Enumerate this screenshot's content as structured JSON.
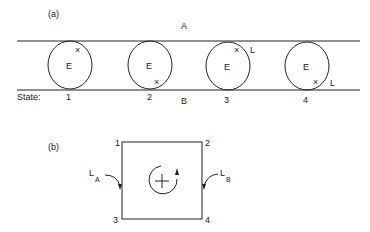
{
  "panel_a": {
    "label": "(a)",
    "region_top": "A",
    "region_bottom": "B",
    "state_label": "State:",
    "circle_label": "E",
    "states": [
      {
        "num": "1",
        "marker": "×",
        "marker_pos": "upper-right",
        "marker_label": ""
      },
      {
        "num": "2",
        "marker": "×",
        "marker_pos": "lower-right",
        "marker_label": ""
      },
      {
        "num": "3",
        "marker": "×",
        "marker_pos": "upper-right",
        "marker_label": "L"
      },
      {
        "num": "4",
        "marker": "×",
        "marker_pos": "lower-right",
        "marker_label": "L"
      }
    ]
  },
  "panel_b": {
    "label": "(b)",
    "corners": {
      "top_left": "1",
      "top_right": "2",
      "bottom_left": "3",
      "bottom_right": "4"
    },
    "left_arrow": {
      "main": "L",
      "sub": "A"
    },
    "right_arrow": {
      "main": "L",
      "sub": "B"
    },
    "center_symbol": "+"
  }
}
